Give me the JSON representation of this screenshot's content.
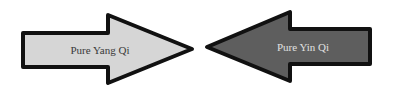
{
  "diagram": {
    "left_arrow": {
      "label": "Pure Yang Qi",
      "direction": "right",
      "fill": "#d6d6d6",
      "text_color": "#3a3a3a"
    },
    "right_arrow": {
      "label": "Pure Yin Qi",
      "direction": "left",
      "fill": "#5e5e5e",
      "text_color": "#e0e0e0"
    },
    "outline_color": "#111111"
  }
}
